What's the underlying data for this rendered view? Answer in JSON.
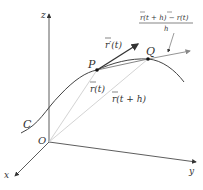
{
  "diagram": {
    "type": "vector-calculus-derivative-of-vector-function",
    "axes": {
      "z": "z",
      "y": "y",
      "x": "x",
      "origin": "O"
    },
    "curve_label": "C",
    "points": {
      "P": "P",
      "Q": "Q"
    },
    "vectors": {
      "r_t": "r(t)",
      "r_t_plus_h": "r(t + h)",
      "r_prime": "r′(t)"
    },
    "quotient": {
      "numerator": "r(t + h) − r(t)",
      "denominator": "h"
    },
    "colors": {
      "ink": "#333333",
      "position_vectors": "#c8c8c8",
      "secant": "#888888"
    }
  }
}
